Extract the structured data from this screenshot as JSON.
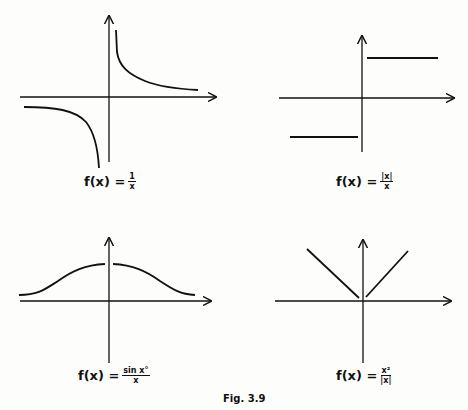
{
  "figure": {
    "caption": "Fig. 3.9",
    "colors": {
      "ink": "#111111",
      "background": "#fdfdfb"
    },
    "panels": [
      {
        "id": "reciprocal",
        "lhs": "f(x) =",
        "numerator": "1",
        "denominator": "x",
        "description": "Hyperbola: branch in quadrant I decreasing toward x-axis, branch in quadrant III decreasing toward -infinity near y-axis"
      },
      {
        "id": "sign",
        "lhs": "f(x) =",
        "numerator": "|x|",
        "denominator": "x",
        "description": "Step function: horizontal line at +1 for x>0 and at -1 for x<0, undefined at 0"
      },
      {
        "id": "sinc-degrees",
        "lhs": "f(x) =",
        "numerator": "sin x°",
        "denominator": "x",
        "description": "Bell-shaped curve symmetric about y-axis with hole at x=0, tails approaching small positive values"
      },
      {
        "id": "abs-like",
        "lhs": "f(x) =",
        "numerator": "x²",
        "denominator": "|x|",
        "description": "V-shape |x| with a hole at the origin"
      }
    ]
  }
}
